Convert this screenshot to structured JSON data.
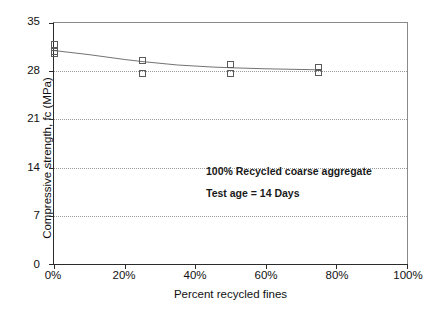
{
  "chart_data": {
    "type": "scatter",
    "title": "",
    "xlabel": "Percent recycled fines",
    "ylabel": "Compressive strength, fc (MPa)",
    "xlim": [
      0,
      100
    ],
    "ylim": [
      0,
      35
    ],
    "x_tick_labels": [
      "0%",
      "20%",
      "40%",
      "60%",
      "80%",
      "100%"
    ],
    "x_tick_values": [
      0,
      20,
      40,
      60,
      80,
      100
    ],
    "y_tick_labels": [
      "0",
      "7",
      "14",
      "21",
      "28",
      "35"
    ],
    "y_tick_values": [
      0,
      7,
      14,
      21,
      28,
      35
    ],
    "grid": "horizontal-dotted",
    "legend": "none",
    "marker_style": "open-square",
    "points": [
      {
        "x": 0,
        "y": 31.9
      },
      {
        "x": 0,
        "y": 30.9
      },
      {
        "x": 0,
        "y": 30.5
      },
      {
        "x": 25,
        "y": 29.5
      },
      {
        "x": 25,
        "y": 27.7
      },
      {
        "x": 50,
        "y": 29.0
      },
      {
        "x": 50,
        "y": 27.6
      },
      {
        "x": 75,
        "y": 28.5
      },
      {
        "x": 75,
        "y": 27.8
      }
    ],
    "series": [
      {
        "name": "trend",
        "style": "thick-solid-line",
        "x": [
          0,
          10,
          20,
          25,
          35,
          45,
          50,
          60,
          70,
          75
        ],
        "values": [
          31.0,
          30.4,
          29.7,
          29.4,
          28.9,
          28.6,
          28.5,
          28.35,
          28.25,
          28.2
        ]
      }
    ],
    "annotations": [
      "100% Recycled  coarse aggregate",
      "Test age = 14 Days"
    ]
  }
}
